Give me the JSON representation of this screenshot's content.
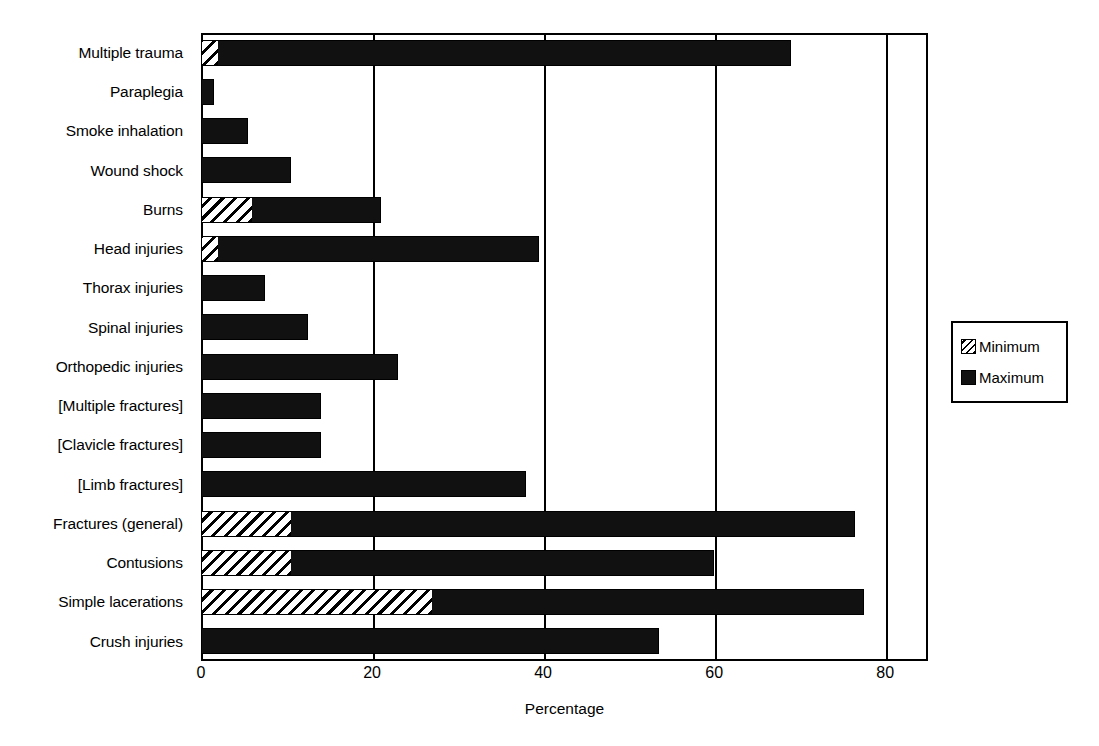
{
  "chart_data": {
    "type": "bar",
    "orientation": "horizontal",
    "title": "",
    "xlabel": "Percentage",
    "ylabel": "",
    "xlim": [
      0,
      85
    ],
    "xticks": [
      0,
      20,
      40,
      60,
      80
    ],
    "xtick_labels": [
      "0",
      "20",
      "40",
      "60",
      "80"
    ],
    "grid": "vertical",
    "legend_position": "right-outside",
    "categories": [
      "Multiple trauma",
      "Paraplegia",
      "Smoke inhalation",
      "Wound shock",
      "Burns",
      "Head injuries",
      "Thorax injuries",
      "Spinal injuries",
      "Orthopedic injuries",
      "[Multiple fractures]",
      "[Clavicle fractures]",
      "[Limb fractures]",
      "Fractures (general)",
      "Contusions",
      "Simple lacerations",
      "Crush injuries"
    ],
    "series": [
      {
        "name": "Minimum",
        "pattern": "diagonal-hatch",
        "values": [
          2,
          0,
          0,
          0,
          6,
          2,
          0,
          0,
          0,
          0,
          0,
          0,
          10.5,
          10.5,
          27,
          0
        ]
      },
      {
        "name": "Maximum",
        "pattern": "solid-black",
        "values": [
          69,
          1.5,
          5.5,
          10.5,
          21,
          39.5,
          7.5,
          12.5,
          23,
          14,
          14,
          38,
          76.5,
          60,
          77.5,
          53.5
        ]
      }
    ]
  },
  "legend": {
    "items": [
      {
        "label": "Minimum",
        "swatch": "hatched-swatch"
      },
      {
        "label": "Maximum",
        "swatch": "solid-swatch"
      }
    ]
  },
  "axis": {
    "x_title": "Percentage"
  },
  "colors": {
    "foreground": "#000000",
    "background": "#ffffff",
    "bar_max_fill": "#111111",
    "bar_min_fill": "#ffffff"
  }
}
